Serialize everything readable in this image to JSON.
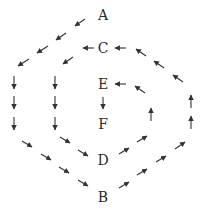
{
  "diagram": {
    "type": "directed flow diagram",
    "nodes": [
      {
        "id": "A",
        "label": "A",
        "x": 103,
        "y": 15
      },
      {
        "id": "C",
        "label": "C",
        "x": 103,
        "y": 48
      },
      {
        "id": "E",
        "label": "E",
        "x": 103,
        "y": 84
      },
      {
        "id": "F",
        "label": "F",
        "x": 103,
        "y": 124
      },
      {
        "id": "D",
        "label": "D",
        "x": 103,
        "y": 160
      },
      {
        "id": "B",
        "label": "B",
        "x": 103,
        "y": 197
      }
    ],
    "paths": [
      {
        "name": "outer-path",
        "description": "A down-left along outer left side, down to B, then up-right along outer right side back to C"
      },
      {
        "name": "inner-path",
        "description": "C down-left along inner left side, down to D, then up-right along inner right side back to E"
      },
      {
        "name": "center-path",
        "description": "E down to F"
      }
    ],
    "arrow_color": "#333333",
    "text_color": "#2a2a2a"
  }
}
